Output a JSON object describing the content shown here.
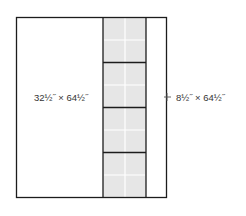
{
  "diagram": {
    "type": "quilt-layout",
    "colors": {
      "outline": "#1c1c1c",
      "strip_fill": "#e6e6e6",
      "seam_light": "#ffffff",
      "background": "#ffffff",
      "text": "#333333"
    },
    "panels": [
      {
        "id": "left-panel",
        "label": "32½\" × 64½\""
      },
      {
        "id": "block-strip",
        "blocks": 4,
        "columns": 2,
        "rows_per_block": 2
      },
      {
        "id": "right-panel",
        "label": "8½\" × 64½\""
      }
    ],
    "labels": {
      "left": "32½˝ × 64½˝",
      "right": "8½˝ × 64½˝"
    }
  }
}
